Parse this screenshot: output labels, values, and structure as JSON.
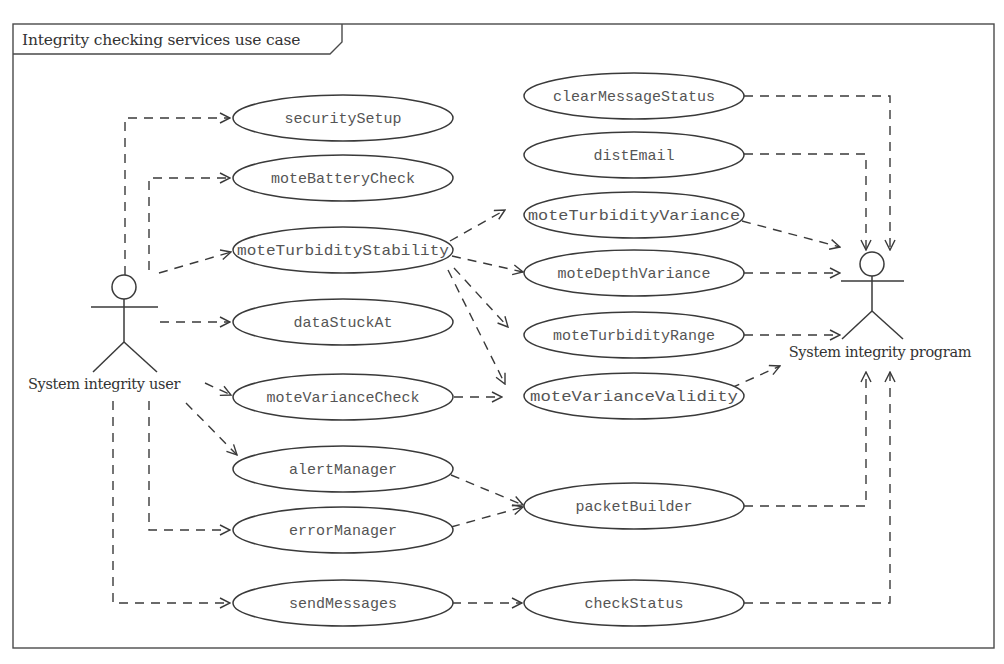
{
  "diagram": {
    "title": "Integrity checking services use case",
    "type": "UML use case diagram",
    "actors": [
      {
        "id": "user",
        "label": "System integrity user"
      },
      {
        "id": "program",
        "label": "System integrity program"
      }
    ],
    "use_cases_left": [
      {
        "id": "securitySetup",
        "label": "securitySetup"
      },
      {
        "id": "moteBatteryCheck",
        "label": "moteBatteryCheck"
      },
      {
        "id": "moteTurbidityStability",
        "label": "moteTurbidityStability"
      },
      {
        "id": "dataStuckAt",
        "label": "dataStuckAt"
      },
      {
        "id": "moteVarianceCheck",
        "label": "moteVarianceCheck"
      },
      {
        "id": "alertManager",
        "label": "alertManager"
      },
      {
        "id": "errorManager",
        "label": "errorManager"
      },
      {
        "id": "sendMessages",
        "label": "sendMessages"
      }
    ],
    "use_cases_right": [
      {
        "id": "clearMessageStatus",
        "label": "clearMessageStatus"
      },
      {
        "id": "distEmail",
        "label": "distEmail"
      },
      {
        "id": "moteTurbidityVariance",
        "label": "moteTurbidityVariance"
      },
      {
        "id": "moteDepthVariance",
        "label": "moteDepthVariance"
      },
      {
        "id": "moteTurbidityRange",
        "label": "moteTurbidityRange"
      },
      {
        "id": "moteVarianceValidity",
        "label": "moteVarianceValidity"
      },
      {
        "id": "packetBuilder",
        "label": "packetBuilder"
      },
      {
        "id": "checkStatus",
        "label": "checkStatus"
      }
    ],
    "relations": [
      {
        "from": "System integrity user",
        "to": "securitySetup"
      },
      {
        "from": "System integrity user",
        "to": "moteBatteryCheck"
      },
      {
        "from": "System integrity user",
        "to": "moteTurbidityStability"
      },
      {
        "from": "System integrity user",
        "to": "dataStuckAt"
      },
      {
        "from": "System integrity user",
        "to": "moteVarianceCheck"
      },
      {
        "from": "System integrity user",
        "to": "alertManager"
      },
      {
        "from": "System integrity user",
        "to": "errorManager"
      },
      {
        "from": "System integrity user",
        "to": "sendMessages"
      },
      {
        "from": "moteTurbidityStability",
        "to": "moteTurbidityVariance"
      },
      {
        "from": "moteTurbidityStability",
        "to": "moteDepthVariance"
      },
      {
        "from": "moteTurbidityStability",
        "to": "moteTurbidityRange"
      },
      {
        "from": "moteTurbidityStability",
        "to": "moteVarianceValidity"
      },
      {
        "from": "moteVarianceCheck",
        "to": "moteVarianceValidity"
      },
      {
        "from": "alertManager",
        "to": "packetBuilder"
      },
      {
        "from": "errorManager",
        "to": "packetBuilder"
      },
      {
        "from": "sendMessages",
        "to": "checkStatus"
      },
      {
        "from": "clearMessageStatus",
        "to": "System integrity program"
      },
      {
        "from": "distEmail",
        "to": "System integrity program"
      },
      {
        "from": "moteTurbidityVariance",
        "to": "System integrity program"
      },
      {
        "from": "moteDepthVariance",
        "to": "System integrity program"
      },
      {
        "from": "moteTurbidityRange",
        "to": "System integrity program"
      },
      {
        "from": "moteVarianceValidity",
        "to": "System integrity program"
      },
      {
        "from": "packetBuilder",
        "to": "System integrity program"
      },
      {
        "from": "checkStatus",
        "to": "System integrity program"
      }
    ]
  }
}
